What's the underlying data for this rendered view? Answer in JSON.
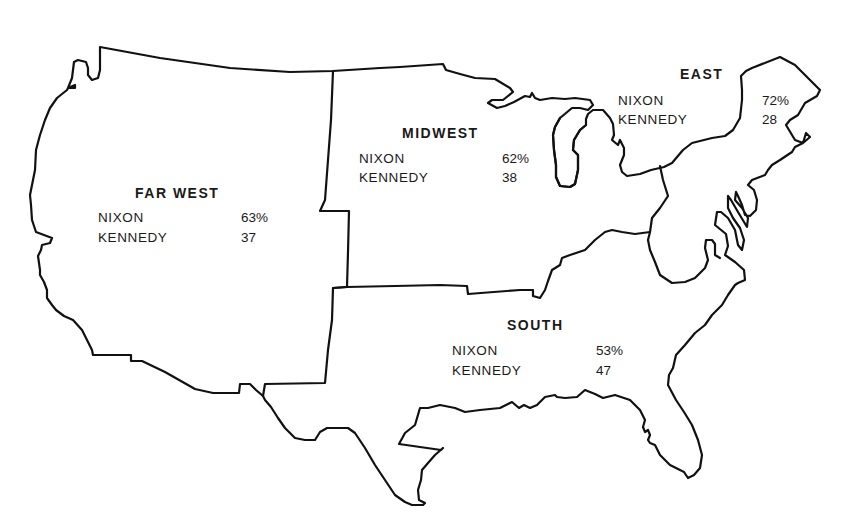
{
  "map": {
    "type": "regional-results-map",
    "subject": "1960 U.S. presidential vote by region",
    "colors": {
      "background": "#ffffff",
      "outline": "#111111",
      "text": "#1a1a1a"
    },
    "candidates": [
      "NIXON",
      "KENNEDY"
    ],
    "regions": [
      {
        "name": "FAR WEST",
        "results": [
          {
            "candidate": "NIXON",
            "value": "63%"
          },
          {
            "candidate": "KENNEDY",
            "value": "37"
          }
        ]
      },
      {
        "name": "MIDWEST",
        "results": [
          {
            "candidate": "NIXON",
            "value": "62%"
          },
          {
            "candidate": "KENNEDY",
            "value": "38"
          }
        ]
      },
      {
        "name": "EAST",
        "results": [
          {
            "candidate": "NIXON",
            "value": "72%"
          },
          {
            "candidate": "KENNEDY",
            "value": "28"
          }
        ]
      },
      {
        "name": "SOUTH",
        "results": [
          {
            "candidate": "NIXON",
            "value": "53%"
          },
          {
            "candidate": "KENNEDY",
            "value": "47"
          }
        ]
      }
    ]
  }
}
